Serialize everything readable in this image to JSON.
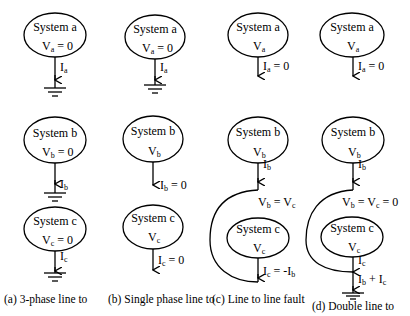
{
  "diagram": {
    "type": "fault-connection-diagrams",
    "stroke_color": "#000000",
    "background": "#ffffff",
    "panels": [
      {
        "id": "a",
        "caption": "(a)  3-phase line to",
        "systems": [
          {
            "name": "System a",
            "voltage": "V",
            "voltage_sub": "a",
            "voltage_eq": " = 0",
            "current": "I",
            "current_sub": "a",
            "current_eq": "",
            "grounded": true
          },
          {
            "name": "System b",
            "voltage": "V",
            "voltage_sub": "b",
            "voltage_eq": " = 0",
            "current": "I",
            "current_sub": "b",
            "current_eq": "",
            "grounded": true
          },
          {
            "name": "System c",
            "voltage": "V",
            "voltage_sub": "c",
            "voltage_eq": " = 0",
            "current": "I",
            "current_sub": "c",
            "current_eq": "",
            "grounded": true
          }
        ]
      },
      {
        "id": "b",
        "caption": "(b)  Single phase line to",
        "systems": [
          {
            "name": "System a",
            "voltage": "V",
            "voltage_sub": "a",
            "voltage_eq": " = 0",
            "current": "I",
            "current_sub": "a",
            "current_eq": "",
            "grounded": true
          },
          {
            "name": "System b",
            "voltage": "V",
            "voltage_sub": "b",
            "voltage_eq": "",
            "current": "I",
            "current_sub": "b",
            "current_eq": " = 0",
            "grounded": false
          },
          {
            "name": "System c",
            "voltage": "V",
            "voltage_sub": "c",
            "voltage_eq": "",
            "current": "I",
            "current_sub": "c",
            "current_eq": " = 0",
            "grounded": false
          }
        ]
      },
      {
        "id": "c",
        "caption": "(c)  Line to line fault",
        "systems": [
          {
            "name": "System a",
            "voltage": "V",
            "voltage_sub": "a",
            "voltage_eq": "",
            "current": "I",
            "current_sub": "a",
            "current_eq": " = 0",
            "grounded": false
          },
          {
            "name": "System b",
            "voltage": "V",
            "voltage_sub": "b",
            "voltage_eq": "",
            "current": "I",
            "current_sub": "b",
            "current_eq": "",
            "grounded": false
          },
          {
            "name": "System c",
            "voltage": "V",
            "voltage_sub": "c",
            "voltage_eq": "",
            "current": "I",
            "current_sub": "c",
            "current_eq": " = -I",
            "current_eq_sub": "b",
            "grounded": false
          }
        ],
        "junction_label": {
          "left": "V",
          "left_sub": "b",
          "mid": " = V",
          "mid_sub": "c",
          "tail": ""
        }
      },
      {
        "id": "d",
        "caption": "(d)  Double line to",
        "systems": [
          {
            "name": "System a",
            "voltage": "V",
            "voltage_sub": "a",
            "voltage_eq": "",
            "current": "I",
            "current_sub": "a",
            "current_eq": " = 0",
            "grounded": false
          },
          {
            "name": "System b",
            "voltage": "V",
            "voltage_sub": "b",
            "voltage_eq": "",
            "current": "I",
            "current_sub": "b",
            "current_eq": "",
            "grounded": false
          },
          {
            "name": "System c",
            "voltage": "V",
            "voltage_sub": "c",
            "voltage_eq": "",
            "current": "I",
            "current_sub": "c",
            "current_eq": "",
            "grounded": true
          }
        ],
        "junction_label": {
          "left": "V",
          "left_sub": "b",
          "mid": " = V",
          "mid_sub": "c",
          "tail": " = 0"
        },
        "ground_current_label": {
          "a": "I",
          "a_sub": "b",
          "plus": " + I",
          "b_sub": "c"
        }
      }
    ]
  }
}
